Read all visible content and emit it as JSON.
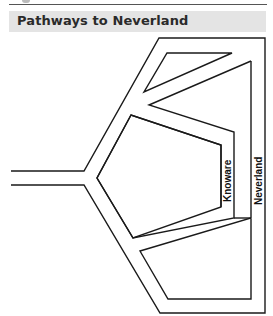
{
  "header": {
    "title": "Pathways to Neverland"
  },
  "diagram": {
    "labels": {
      "knoware": "Knoware",
      "neverland": "Neverland"
    },
    "colors": {
      "stroke": "#1a1a1a",
      "header_bg": "#e4e4e4",
      "title_text": "#2a2a2a"
    }
  }
}
